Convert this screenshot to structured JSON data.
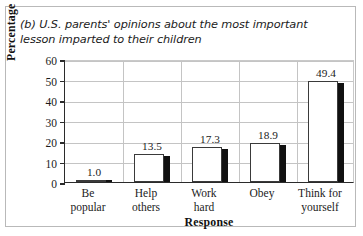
{
  "chart_data": {
    "type": "bar",
    "title": "(b) U.S. parents' opinions about the most important lesson imparted to their children",
    "xlabel": "Response",
    "ylabel": "Percentage",
    "categories": [
      "Be popular",
      "Help others",
      "Work hard",
      "Obey",
      "Think for yourself"
    ],
    "category_lines": [
      [
        "Be",
        "popular"
      ],
      [
        "Help",
        "others"
      ],
      [
        "Work",
        "hard"
      ],
      [
        "Obey",
        ""
      ],
      [
        "Think for",
        "yourself"
      ]
    ],
    "values": [
      1.0,
      13.5,
      17.3,
      18.9,
      49.4
    ],
    "value_labels": [
      "1.0",
      "13.5",
      "17.3",
      "18.9",
      "49.4"
    ],
    "ylim": [
      0,
      60
    ],
    "yticks": [
      0,
      10,
      20,
      30,
      40,
      50,
      60
    ],
    "ytick_labels": [
      "0",
      "10",
      "20",
      "30",
      "40",
      "50",
      "60"
    ],
    "grid": true,
    "legend": "none",
    "bar_style": "hollow-white-with-black-side-shadow",
    "colors": {
      "bar_fill": "#ffffff",
      "bar_outline": "#3a3a3a",
      "bar_shadow": "#111111",
      "gridline": "#c4c4c4",
      "axis": "#2b2b2b",
      "text": "#1b1b1b",
      "frame": "#b9b9b9",
      "background": "#ffffff"
    }
  }
}
